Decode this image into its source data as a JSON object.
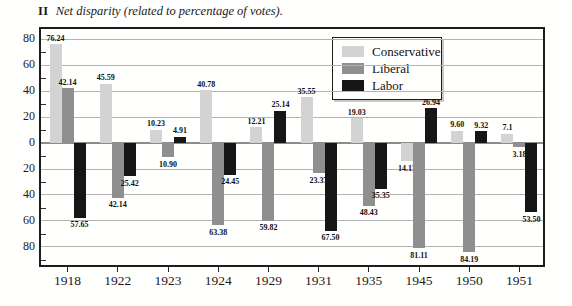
{
  "title": {
    "numeral": "II",
    "text": "Net disparity (related to percentage of votes)."
  },
  "legend": {
    "position": "top-right",
    "entries": [
      {
        "label": "Conservative",
        "color": "#d3d3d3"
      },
      {
        "label": "Liberal",
        "color": "#8f8f8f"
      },
      {
        "label": "Labor",
        "color": "#161616"
      }
    ]
  },
  "chart_data": {
    "type": "bar",
    "categories": [
      "1918",
      "1922",
      "1923",
      "1924",
      "1929",
      "1931",
      "1935",
      "1945",
      "1950",
      "1951"
    ],
    "series": [
      {
        "name": "Conservative",
        "color": "#d3d3d3",
        "values": [
          76.24,
          45.59,
          10.23,
          40.78,
          12.21,
          35.55,
          19.03,
          -14.13,
          9.6,
          7.1
        ],
        "labels": [
          "76.24",
          "45.59",
          "10.23",
          "40.78",
          "12.21",
          "35.55",
          "19.03",
          "14.13",
          "9.60",
          "7.1"
        ]
      },
      {
        "name": "Liberal",
        "color": "#8f8f8f",
        "values": [
          42.14,
          -42.14,
          -10.9,
          -63.38,
          -59.82,
          -23.37,
          -48.43,
          -81.11,
          -84.19,
          -3.18
        ],
        "labels": [
          "42.14",
          "42.14",
          "10.90",
          "63.38",
          "59.82",
          "23.37",
          "48.43",
          "81.11",
          "84.19",
          "3.18"
        ]
      },
      {
        "name": "Labor",
        "color": "#161616",
        "values": [
          -57.65,
          -25.42,
          4.91,
          -24.45,
          25.14,
          -67.5,
          -35.35,
          26.94,
          9.32,
          -53.5
        ],
        "labels": [
          "57.65",
          "25.42",
          "4.91",
          "24.45",
          "25.14",
          "67.50",
          "35.35",
          "26.94",
          "9.32",
          "53.50"
        ]
      }
    ],
    "xlabel": "",
    "ylabel": "",
    "ylim": [
      -94,
      88
    ],
    "y_major_step": 20,
    "y_minor_step": 10,
    "y_ticks": [
      {
        "value": 80,
        "label": "80"
      },
      {
        "value": 60,
        "label": "60"
      },
      {
        "value": 40,
        "label": "40"
      },
      {
        "value": 20,
        "label": "20"
      },
      {
        "value": 0,
        "label": "0"
      },
      {
        "value": -20,
        "label": "20"
      },
      {
        "value": -40,
        "label": "40"
      },
      {
        "value": -60,
        "label": "60"
      },
      {
        "value": -80,
        "label": "80"
      }
    ],
    "grid": true,
    "legend_position": "top-right"
  }
}
